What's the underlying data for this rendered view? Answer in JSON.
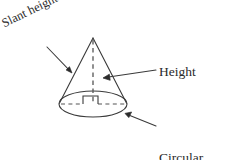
{
  "figure": {
    "shape": "cone",
    "background_color": "#ffffff",
    "stroke_color": "#3a3a3a",
    "text_color": "#2b2b2b",
    "canvas": {
      "width": 229,
      "height": 160
    },
    "geometry": {
      "apex": {
        "x": 93,
        "y": 38
      },
      "base_center": {
        "x": 93,
        "y": 104
      },
      "base_radius_x": 34,
      "base_radius_y": 13,
      "height_line_style": "dashed",
      "diameter_line_style": "dashed",
      "right_angle_marker": {
        "x": 83,
        "y": 96,
        "width": 15,
        "height": 8
      }
    }
  },
  "labels": {
    "slant_height": {
      "text": "Slant height",
      "rotation_deg": -26,
      "pointer_tip": {
        "x": 72,
        "y": 73
      },
      "pointer_tail": {
        "x": 47,
        "y": 47
      }
    },
    "height": {
      "text": "Height",
      "pointer_tip": {
        "x": 103,
        "y": 78
      },
      "pointer_tail": {
        "x": 156,
        "y": 70
      }
    },
    "circular_base": {
      "line1": "Circular",
      "line2": "base",
      "pointer_tip": {
        "x": 125,
        "y": 113
      },
      "pointer_tail": {
        "x": 156,
        "y": 126
      }
    }
  }
}
